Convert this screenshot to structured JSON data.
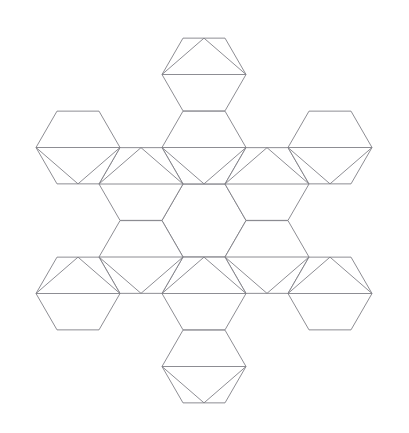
{
  "figure": {
    "background_color": "#ffffff",
    "stroke_color": "#808087",
    "fill_color": "#ffffff",
    "stroke_width": 0.9,
    "canvas": {
      "width": 409,
      "height": 433
    }
  },
  "chart_data": {
    "type": "diagram",
    "title": "Hexagonal snowflake net",
    "shape_kind": "polyhedron net / tessellation",
    "units": "pixels",
    "geometry": {
      "hexagon_orientation": "flat-top",
      "circumradius": 42,
      "hex_width_across_flats": 72.7,
      "hex_width_across_corners": 84,
      "center_point": {
        "x": 204,
        "y": 220.5
      },
      "ring_spacing_x": 63,
      "ring_spacing_y": 36.37
    },
    "counts": {
      "hexagons_total": 13,
      "hexagons_center": 1,
      "hexagons_inner_ring": 6,
      "hexagons_outer_ring": 6,
      "inscribed_triangles": 12,
      "triangles_pointing_up": 6,
      "triangles_pointing_down": 6
    },
    "hexagons": [
      {
        "id": "center",
        "cx": 204,
        "cy": 220.5,
        "triangle": "none"
      },
      {
        "id": "inner-n",
        "cx": 204,
        "cy": 147.5,
        "triangle": "down"
      },
      {
        "id": "inner-ne",
        "cx": 267,
        "cy": 184.0,
        "triangle": "up"
      },
      {
        "id": "inner-se",
        "cx": 267,
        "cy": 257.0,
        "triangle": "down"
      },
      {
        "id": "inner-s",
        "cx": 204,
        "cy": 293.5,
        "triangle": "up"
      },
      {
        "id": "inner-sw",
        "cx": 141,
        "cy": 257.0,
        "triangle": "down"
      },
      {
        "id": "inner-nw",
        "cx": 141,
        "cy": 184.0,
        "triangle": "up"
      },
      {
        "id": "outer-n",
        "cx": 204,
        "cy": 74.5,
        "triangle": "up"
      },
      {
        "id": "outer-ne",
        "cx": 330,
        "cy": 147.5,
        "triangle": "down"
      },
      {
        "id": "outer-se",
        "cx": 330,
        "cy": 293.5,
        "triangle": "up"
      },
      {
        "id": "outer-s",
        "cx": 204,
        "cy": 366.5,
        "triangle": "down"
      },
      {
        "id": "outer-sw",
        "cx": 78,
        "cy": 293.5,
        "triangle": "up"
      },
      {
        "id": "outer-nw",
        "cx": 78,
        "cy": 147.5,
        "triangle": "down"
      }
    ],
    "bounds": {
      "x_min": 22,
      "x_max": 386,
      "y_min": 26,
      "y_max": 408
    },
    "symmetry": "6-fold rotational (D6-like arrangement), alternating triangle orientation",
    "legend": [],
    "annotations": []
  }
}
